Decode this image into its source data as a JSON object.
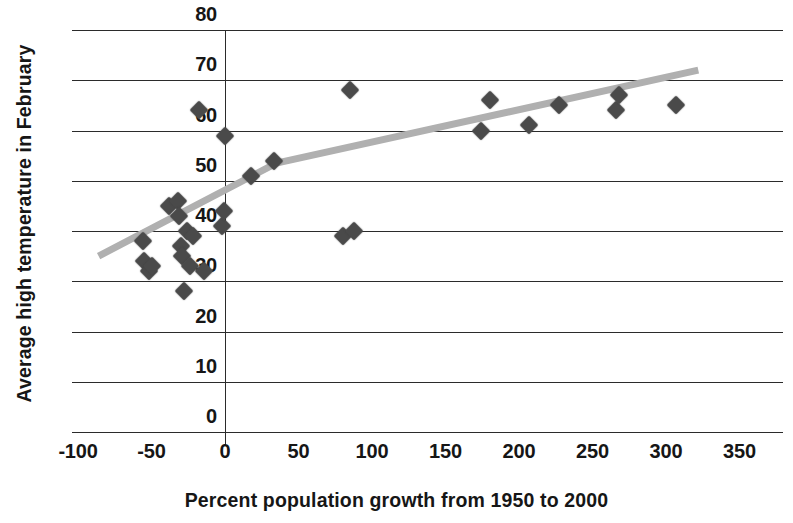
{
  "chart_data": {
    "type": "scatter",
    "title": "",
    "xlabel": "Percent population growth from 1950 to 2000",
    "ylabel": "Average high temperature in February",
    "xlim": [
      -100,
      350
    ],
    "ylim": [
      0,
      80
    ],
    "xticks": [
      "-100",
      "-50",
      "0",
      "50",
      "100",
      "150",
      "200",
      "250",
      "300",
      "350"
    ],
    "xtick_values": [
      -100,
      -50,
      0,
      50,
      100,
      150,
      200,
      250,
      300,
      350
    ],
    "yticks": [
      "0",
      "10",
      "20",
      "30",
      "40",
      "50",
      "60",
      "70",
      "80"
    ],
    "ytick_values": [
      0,
      10,
      20,
      30,
      40,
      50,
      60,
      70,
      80
    ],
    "grid": "horizontal",
    "legend": "none",
    "marker": "diamond",
    "marker_color": "#4a4a4a",
    "points": [
      {
        "x": -56,
        "y": 38
      },
      {
        "x": -55,
        "y": 34
      },
      {
        "x": -52,
        "y": 32
      },
      {
        "x": -50,
        "y": 33
      },
      {
        "x": -38,
        "y": 45
      },
      {
        "x": -32,
        "y": 46
      },
      {
        "x": -31,
        "y": 43
      },
      {
        "x": -30,
        "y": 37
      },
      {
        "x": -29,
        "y": 35
      },
      {
        "x": -28,
        "y": 28
      },
      {
        "x": -26,
        "y": 40
      },
      {
        "x": -24,
        "y": 33
      },
      {
        "x": -22,
        "y": 39
      },
      {
        "x": -18,
        "y": 64
      },
      {
        "x": -14,
        "y": 32
      },
      {
        "x": -2,
        "y": 41
      },
      {
        "x": -1,
        "y": 44
      },
      {
        "x": 0,
        "y": 59
      },
      {
        "x": 18,
        "y": 51
      },
      {
        "x": 33,
        "y": 54
      },
      {
        "x": 80,
        "y": 39
      },
      {
        "x": 85,
        "y": 68
      },
      {
        "x": 88,
        "y": 40
      },
      {
        "x": 174,
        "y": 60
      },
      {
        "x": 180,
        "y": 66
      },
      {
        "x": 207,
        "y": 61
      },
      {
        "x": 227,
        "y": 65
      },
      {
        "x": 266,
        "y": 64
      },
      {
        "x": 268,
        "y": 67
      },
      {
        "x": 307,
        "y": 65
      }
    ],
    "trendline": {
      "color": "#b0b0b0",
      "style": "solid",
      "segments": [
        {
          "x": -86,
          "y": 35.0
        },
        {
          "x": 35,
          "y": 53.5
        },
        {
          "x": 322,
          "y": 72.0
        }
      ]
    }
  }
}
